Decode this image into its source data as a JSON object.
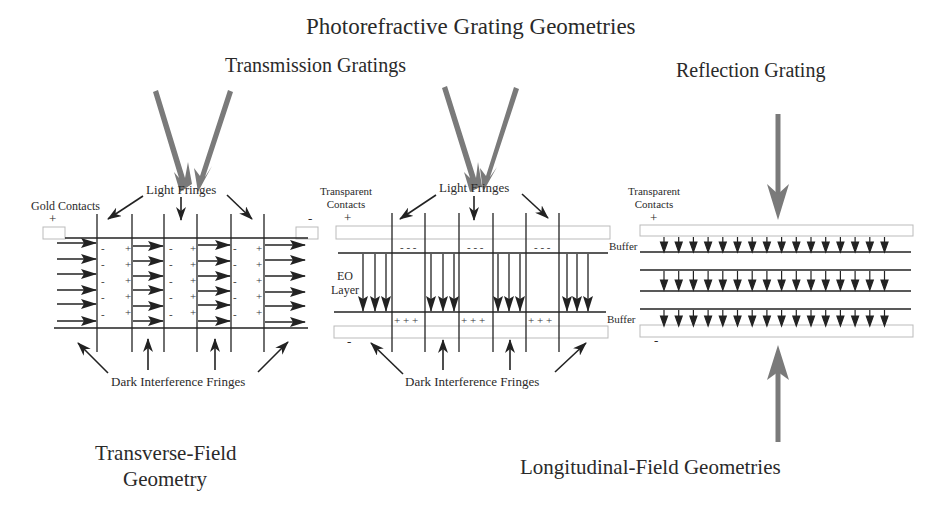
{
  "title": "Photorefractive Grating Geometries",
  "sections": {
    "transmission": {
      "heading": "Transmission Gratings",
      "left_panel": {
        "contacts_label": "Gold Contacts",
        "plus": "+",
        "minus": "-",
        "light_fringes_label": "Light Fringes",
        "dark_fringes_label": "Dark Interference Fringes",
        "caption_line1": "Transverse-Field",
        "caption_line2": "Geometry"
      },
      "middle_panel": {
        "contacts_label_line1": "Transparent",
        "contacts_label_line2": "Contacts",
        "plus": "+",
        "minus": "-",
        "light_fringes_label": "Light Fringes",
        "eo_label_line1": "EO",
        "eo_label_line2": "Layer",
        "buffer_top": "Buffer",
        "buffer_bottom": "Buffer",
        "neg_charges": "- - -",
        "pos_charges": "+ + +",
        "dark_fringes_label": "Dark Interference Fringes"
      }
    },
    "reflection": {
      "heading": "Reflection Grating",
      "right_panel": {
        "contacts_label_line1": "Transparent",
        "contacts_label_line2": "Contacts",
        "plus": "+",
        "minus": "-",
        "arrow_rows": 3,
        "arrows_per_row": 16
      },
      "caption": "Longitudinal-Field Geometries"
    }
  },
  "colors": {
    "beam_arrow": "#7a7a7a",
    "line": "#222222",
    "contact_outline": "#bbbbbb"
  }
}
